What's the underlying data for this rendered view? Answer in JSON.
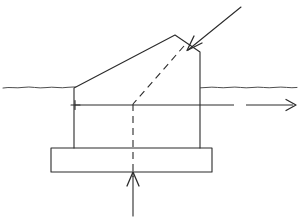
{
  "diagram": {
    "type": "engineering-line-drawing",
    "canvas": {
      "width": 300,
      "height": 221,
      "background": "#ffffff"
    },
    "stroke_color": "#2b2b2b",
    "elements": {
      "ground_line": {
        "name": "ground-surface-line",
        "style": "wavy-solid",
        "y": 87,
        "x_start": 2,
        "x_end": 298
      },
      "structure_body": {
        "name": "wedge-body-outline",
        "style": "solid-polygon",
        "vertices": "74,148 74,88 175,35 200,52 200,148"
      },
      "base_block": {
        "name": "base-footing-rectangle",
        "style": "solid-rectangle",
        "x": 51,
        "y": 148,
        "width": 161,
        "height": 24
      },
      "axis_line": {
        "name": "horizontal-reference-axis",
        "style": "solid-with-gap-arrow",
        "y": 105,
        "x_start": 75,
        "x_end": 296,
        "gap_start": 234,
        "gap_end": 246
      },
      "cross_mark": {
        "name": "origin-cross-marker",
        "x": 75,
        "y": 105,
        "size": 6
      },
      "dashed_slip_line": {
        "name": "dashed-failure-plane",
        "style": "dashed-polyline",
        "points": "183,47 133,104"
      },
      "dashed_center_line": {
        "name": "dashed-centerline",
        "style": "dashed-vertical",
        "x": 133,
        "y_start": 104,
        "y_end": 176
      },
      "load_arrow_top": {
        "name": "applied-load-arrow-top-right",
        "style": "solid-arrow",
        "from_x": 241,
        "from_y": 7,
        "to_x": 187,
        "to_y": 50,
        "direction": "down-left"
      },
      "reaction_arrow_bottom": {
        "name": "reaction-force-arrow-bottom",
        "style": "solid-arrow",
        "from_x": 133,
        "from_y": 216,
        "to_x": 133,
        "to_y": 172,
        "direction": "up"
      },
      "axis_arrow_right": {
        "name": "axis-direction-arrow-right",
        "style": "solid-arrowhead",
        "tip_x": 296,
        "tip_y": 105,
        "direction": "right"
      }
    }
  }
}
